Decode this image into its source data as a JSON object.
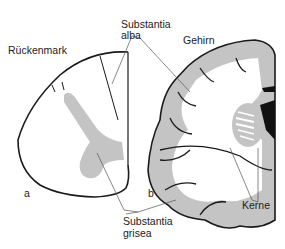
{
  "labels": {
    "spinal_cord": "Rückenmark",
    "white_matter_line1": "Substantia",
    "white_matter_line2": "alba",
    "brain": "Gehirn",
    "gray_matter_line1": "Substantia",
    "gray_matter_line2": "grisea",
    "nuclei": "Kerne",
    "panel_a": "a",
    "panel_b": "b"
  },
  "colors": {
    "gray_matter": "#bdbdbd",
    "outline": "#1a1a1a",
    "leader_line": "#555555",
    "background": "#ffffff"
  }
}
